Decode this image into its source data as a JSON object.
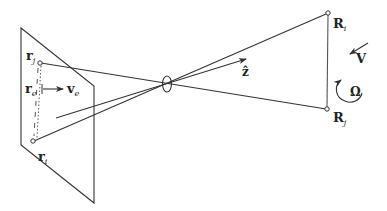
{
  "diagram": {
    "labels": {
      "r_j": {
        "base": "r",
        "sub": "j"
      },
      "r_e": {
        "base": "r",
        "sub": "e"
      },
      "v_e": {
        "base": "v",
        "sub": "e"
      },
      "r_i": {
        "base": "r",
        "sub": "i"
      },
      "z_hat": {
        "base": "ẑ"
      },
      "R_i": {
        "base": "R",
        "sub": "i"
      },
      "R_j": {
        "base": "R",
        "sub": "j"
      },
      "V": {
        "base": "V"
      },
      "Omega": {
        "base": "Ω"
      }
    },
    "colors": {
      "stroke": "#333333",
      "text": "#222222",
      "background": "#ffffff"
    }
  }
}
